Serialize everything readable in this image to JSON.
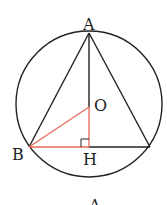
{
  "diagram": {
    "labels": {
      "A": "A",
      "O": "O",
      "B": "B",
      "H": "H",
      "bottom_caption": "A"
    },
    "points": {
      "A": [
        89,
        33
      ],
      "O": [
        89,
        107
      ],
      "B": [
        29,
        147
      ],
      "H": [
        89,
        147
      ],
      "C": [
        150,
        147
      ]
    },
    "circle": {
      "cx": 89,
      "cy": 104,
      "r": 73
    },
    "colors": {
      "stroke": "#222222",
      "highlight": "#e8685a"
    }
  }
}
